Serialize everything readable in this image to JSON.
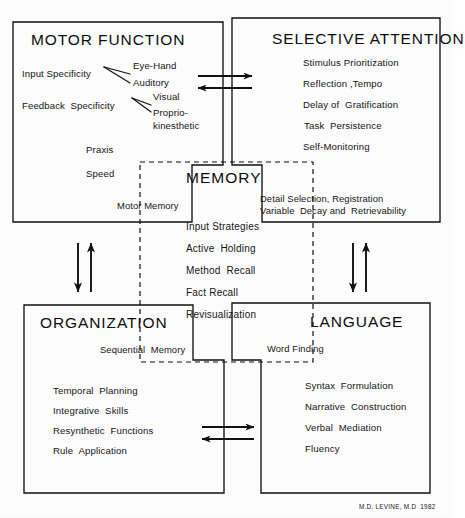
{
  "figure": {
    "credit": "M.D. LEVINE, M.D  1982",
    "background_color": "#fdfdfd",
    "line_color": "#111111"
  },
  "quadrants": {
    "motor_function": {
      "title": "MOTOR FUNCTION",
      "branch_groups": [
        {
          "label": "Input Specificity",
          "children": [
            "Eye-Hand",
            "Auditory"
          ]
        },
        {
          "label": "Feedback  Specificity",
          "children": [
            "Visual",
            "Proprio-",
            "kinesthetic"
          ]
        }
      ],
      "items": [
        "Praxis",
        "Speed"
      ],
      "bridge_label": "Motor Memory"
    },
    "selective_attention": {
      "title": "SELECTIVE ATTENTION",
      "items": [
        "Stimulus Prioritization",
        "Reflection ,Tempo",
        "Delay of  Gratification",
        "Task  Persistence",
        "Self-Monitoring"
      ],
      "bridge_label_line1": "Detail Selection, Registration",
      "bridge_label_line2": "Variable  Decay and  Retrievability"
    },
    "organization": {
      "title": "ORGANIZATION",
      "bridge_label": "Sequential  Memory",
      "items": [
        "Temporal  Planning",
        "Integrative  Skills",
        "Resynthetic  Functions",
        "Rule  Application"
      ]
    },
    "language": {
      "title": "LANGUAGE",
      "bridge_label": "Word Finding",
      "items": [
        "Syntax  Formulation",
        "Narrative  Construction",
        "Verbal  Mediation",
        "Fluency"
      ]
    }
  },
  "center": {
    "title": "MEMORY",
    "items": [
      "Input Strategies",
      "Active  Holding",
      "Method  Recall",
      "Fact Recall",
      "Revisualization"
    ]
  },
  "connectors": {
    "top": {
      "name": "bidirectional-horizontal-arrow",
      "directions": [
        "right",
        "left"
      ]
    },
    "bottom": {
      "name": "bidirectional-horizontal-arrow",
      "directions": [
        "right",
        "left"
      ]
    },
    "left": {
      "name": "bidirectional-vertical-arrow",
      "directions": [
        "down",
        "up"
      ]
    },
    "right": {
      "name": "bidirectional-vertical-arrow",
      "directions": [
        "down",
        "up"
      ]
    }
  }
}
